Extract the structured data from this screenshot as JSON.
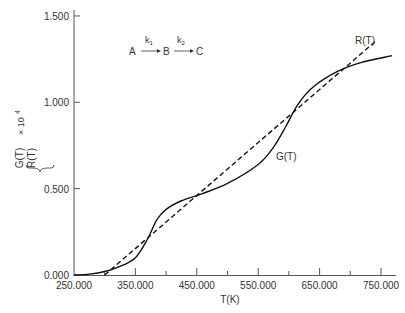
{
  "chart_data": {
    "type": "line",
    "title": "",
    "xlabel": "T(K)",
    "ylabel_top": "G(T)",
    "ylabel_bottom": "R(T)",
    "ylabel_factor": "× 10",
    "ylabel_exponent": "4",
    "xlim": [
      250,
      780
    ],
    "ylim": [
      0,
      1.5
    ],
    "grid": false,
    "x_ticks_major": [
      250,
      350,
      450,
      550,
      650,
      750
    ],
    "x_tick_labels": [
      "250.000",
      "350.000",
      "450.000",
      "550.000",
      "650.000",
      "750.000"
    ],
    "x_ticks_minor": [
      300,
      400,
      500,
      600,
      700
    ],
    "y_ticks": [
      0,
      0.5,
      1.0,
      1.5
    ],
    "y_tick_labels": [
      "0.000",
      "0.500",
      "1.000",
      "1.500"
    ],
    "series": [
      {
        "name": "G(T)",
        "style": "solid",
        "x": [
          250,
          275,
          300,
          325,
          350,
          370,
          385,
          400,
          425,
          458,
          500,
          550,
          575,
          595,
          615,
          640,
          680,
          717,
          768
        ],
        "y": [
          0.0,
          0.005,
          0.02,
          0.05,
          0.1,
          0.21,
          0.32,
          0.38,
          0.43,
          0.47,
          0.53,
          0.64,
          0.74,
          0.86,
          0.99,
          1.09,
          1.18,
          1.23,
          1.27
        ]
      },
      {
        "name": "R(T)",
        "style": "dashed",
        "x": [
          300,
          740
        ],
        "y": [
          0.0,
          1.35
        ]
      }
    ],
    "annotations": [
      {
        "text": "G(T)",
        "x": 590,
        "y": 0.69
      },
      {
        "text": "R(T)",
        "x": 715,
        "y": 1.37
      }
    ],
    "scheme": {
      "species": [
        "A",
        "B",
        "C"
      ],
      "rates": [
        {
          "base": "k",
          "sub": "1"
        },
        {
          "base": "k",
          "sub": "2"
        }
      ]
    }
  }
}
